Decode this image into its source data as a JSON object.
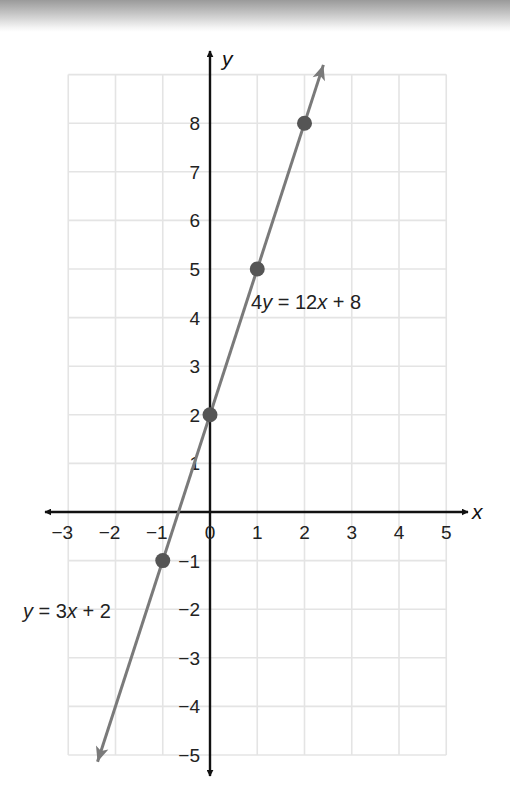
{
  "chart_data": {
    "type": "line",
    "title": "",
    "xlabel": "x",
    "ylabel": "y",
    "xlim": [
      -3,
      5
    ],
    "ylim": [
      -5,
      9
    ],
    "grid": true,
    "x_ticks": [
      -3,
      -2,
      -1,
      0,
      1,
      2,
      3,
      4,
      5
    ],
    "x_tick_labels": [
      "−3",
      "−2",
      "−1",
      "0",
      "1",
      "2",
      "3",
      "4",
      "5"
    ],
    "y_ticks": [
      -5,
      -4,
      -3,
      -2,
      -1,
      1,
      2,
      3,
      4,
      5,
      6,
      7,
      8
    ],
    "y_tick_labels": [
      "−5",
      "−4",
      "−3",
      "−2",
      "−1",
      "1",
      "2",
      "3",
      "4",
      "5",
      "6",
      "7",
      "8"
    ],
    "series": [
      {
        "name": "y = 3x + 2",
        "equivalent": "4y = 12x + 8",
        "slope": 3,
        "intercept": 2,
        "line_endpoints": [
          [
            -2.38,
            -5.14
          ],
          [
            2.4,
            9.2
          ]
        ],
        "points": [
          {
            "x": -1,
            "y": -1
          },
          {
            "x": 0,
            "y": 2
          },
          {
            "x": 1,
            "y": 5
          },
          {
            "x": 2,
            "y": 8
          }
        ]
      }
    ],
    "annotations": [
      {
        "text_parts": [
          "4",
          "y",
          " = 12",
          "x",
          " + 8"
        ],
        "near": [
          1,
          5
        ]
      },
      {
        "text_parts": [
          "y",
          " = 3",
          "x",
          " + 2"
        ],
        "near": [
          -2.5,
          -2
        ]
      }
    ]
  },
  "colors": {
    "grid": "#e4e4e4",
    "axis": "#111111",
    "line": "#7a7a7a",
    "point": "#555555"
  },
  "labels": {
    "x_axis": "x",
    "y_axis": "y",
    "eq_upper": {
      "a": "4",
      "b": "y",
      "c": " = 12",
      "d": "x",
      "e": " + 8"
    },
    "eq_lower": {
      "a": "y",
      "b": " = 3",
      "c": "x",
      "d": " + 2"
    }
  }
}
